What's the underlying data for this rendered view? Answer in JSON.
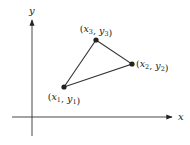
{
  "diagram": {
    "axes": {
      "x_label": "x",
      "y_label": "y",
      "origin": [
        32,
        117
      ],
      "x_axis": {
        "from": [
          12,
          117
        ],
        "to": [
          172,
          117
        ]
      },
      "y_axis": {
        "from": [
          32,
          136
        ],
        "to": [
          32,
          20
        ]
      },
      "color": "#333333"
    },
    "points": [
      {
        "id": "p1",
        "x_sym": "x",
        "x_sub": "1",
        "y_sym": "y",
        "y_sub": "1",
        "pos": [
          64,
          87
        ],
        "label_pos": [
          64,
          100
        ],
        "anchor": "middle"
      },
      {
        "id": "p2",
        "x_sym": "x",
        "x_sub": "2",
        "y_sym": "y",
        "y_sub": "2",
        "pos": [
          132,
          64
        ],
        "label_pos": [
          136,
          67
        ],
        "anchor": "start"
      },
      {
        "id": "p3",
        "x_sym": "x",
        "x_sub": "3",
        "y_sym": "y",
        "y_sub": "3",
        "pos": [
          96,
          40
        ],
        "label_pos": [
          96,
          32
        ],
        "anchor": "middle"
      }
    ],
    "triangle": {
      "vertices": [
        "p1",
        "p3",
        "p2"
      ],
      "stroke": "#333333"
    }
  }
}
